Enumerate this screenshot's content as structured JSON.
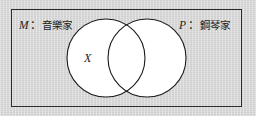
{
  "figure": {
    "type": "venn-diagram",
    "universe_label": "",
    "background_color": "#d4d4d4",
    "box_border_color": "#2b2b2b",
    "circle_fill_color": "#ffffff",
    "circle_stroke_color": "#1a1a1a"
  },
  "labels": {
    "left_set": {
      "symbol": "M",
      "colon": "：",
      "name": "音樂家"
    },
    "right_set": {
      "symbol": "P",
      "colon": "：",
      "name": "鋼琴家"
    },
    "region_marker": "X"
  },
  "chart_data": {
    "type": "diagram",
    "title": "",
    "sets": [
      {
        "id": "M",
        "label": "M：音樂家",
        "symbol": "M",
        "name": "音樂家",
        "cx": 106,
        "cy": 58,
        "r": 39
      },
      {
        "id": "P",
        "label": "P：鋼琴家",
        "symbol": "P",
        "name": "鋼琴家",
        "cx": 147,
        "cy": 58,
        "r": 39
      }
    ],
    "annotations": [
      {
        "text": "X",
        "region": "M-only",
        "x": 90,
        "y": 59
      }
    ],
    "universe": {
      "x": 11,
      "y": 9,
      "width": 231,
      "height": 98
    }
  }
}
